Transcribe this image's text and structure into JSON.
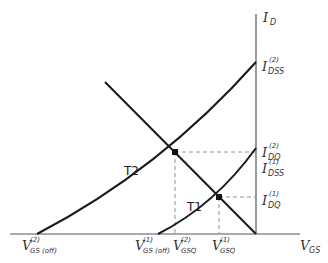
{
  "diagram": {
    "axes": {
      "y_label_main": "I",
      "y_label_sub": "D",
      "x_label_main": "V",
      "x_label_sub": "GS"
    },
    "curves": [
      {
        "name": "T2",
        "label": "T2"
      },
      {
        "name": "T1",
        "label": "T1"
      }
    ],
    "y_labels": [
      {
        "main": "I",
        "sup": "(2)",
        "sub": "DSS"
      },
      {
        "main": "I",
        "sup": "(2)",
        "sub": "DQ"
      },
      {
        "main": "I",
        "sup": "(1)",
        "sub": "DSS"
      },
      {
        "main": "I",
        "sup": "(1)",
        "sub": "DQ"
      }
    ],
    "x_labels": [
      {
        "main": "V",
        "sup": "(2)",
        "sub": "GS (off)"
      },
      {
        "main": "V",
        "sup": "(1)",
        "sub": "GS (off)"
      },
      {
        "main": "V",
        "sup": "(2)",
        "sub": "GSQ"
      },
      {
        "main": "V",
        "sup": "(1)",
        "sub": "GSQ"
      }
    ],
    "colors": {
      "line": "#1a1a1a",
      "dashed": "#888888"
    }
  }
}
